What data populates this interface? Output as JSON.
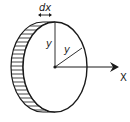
{
  "diagram": {
    "labels": {
      "thickness": "dx",
      "radius_vertical": "y",
      "radius_diagonal": "y",
      "axis": "X"
    },
    "colors": {
      "stroke": "#1a1a1a",
      "background": "#ffffff"
    }
  }
}
